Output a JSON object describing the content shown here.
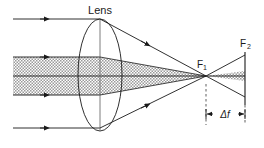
{
  "figure": {
    "type": "optics-ray-diagram",
    "width": 264,
    "height": 148,
    "background_color": "#ffffff",
    "line_color": "#1a1a1a",
    "beam_fill_color": "#b4b4b4",
    "beam_hatch_style": "cross-hatch-dots"
  },
  "labels": {
    "lens": "Lens",
    "focus_near": "F",
    "focus_near_sub": "1",
    "focus_far": "F",
    "focus_far_sub": "2",
    "delta_f": "Δf"
  },
  "elements": {
    "lens": {
      "name": "biconvex-lens",
      "center_x": 100,
      "center_y": 75,
      "radius_x": 22,
      "radius_y": 56
    },
    "optical_axis": {
      "name": "optical-axis",
      "y": 76,
      "x_start": 13,
      "x_end": 245
    },
    "focus_near_point": {
      "x": 206,
      "y": 76
    },
    "focus_far_point": {
      "x": 245,
      "y": 76
    },
    "screen": {
      "x": 245,
      "y_top": 52,
      "y_bottom": 105
    },
    "delta_f_dimension": {
      "x_left": 206,
      "x_right": 245,
      "y": 114
    }
  },
  "rays": {
    "incoming_outer_top": {
      "y": 19,
      "x_start": 13,
      "x_end": 100,
      "arrow_x": 45
    },
    "incoming_inner_top": {
      "y": 57,
      "x_start": 13,
      "x_end": 100,
      "arrow_x": 45
    },
    "incoming_axis": {
      "y": 76,
      "x_start": 13,
      "x_end": 100
    },
    "incoming_inner_bottom": {
      "y": 95,
      "x_start": 13,
      "x_end": 100,
      "arrow_x": 45
    },
    "incoming_outer_bottom": {
      "y": 128,
      "x_start": 13,
      "x_end": 100,
      "arrow_x": 45
    },
    "marginal_top": {
      "x1": 100,
      "y1": 19,
      "x2": 206,
      "y2": 76,
      "arrow_t": 0.45
    },
    "marginal_bottom": {
      "x1": 100,
      "y1": 128,
      "x2": 206,
      "y2": 76,
      "arrow_t": 0.45
    },
    "marginal_top_extended": {
      "x1": 206,
      "y1": 76,
      "x2": 245,
      "y2": 97
    },
    "marginal_bottom_extended": {
      "x1": 206,
      "y1": 76,
      "x2": 245,
      "y2": 55
    }
  },
  "beams": {
    "paraxial_incoming_band": {
      "y_top": 57,
      "y_bottom": 95,
      "x_start": 13,
      "x_end": 100
    },
    "paraxial_cone": {
      "lens_top_y": 57,
      "lens_bottom_y": 95,
      "apex_x": 206,
      "apex_y": 76
    },
    "after_focus_wedge": {
      "apex_x": 206,
      "apex_y": 76,
      "end_x": 245,
      "half_height": 5
    }
  },
  "guides": {
    "dashed_vertical_near": {
      "x": 206,
      "y_top": 88,
      "y_bottom": 125
    },
    "dashed_vertical_far": {
      "x": 245,
      "y_top": 105,
      "y_bottom": 125
    }
  }
}
